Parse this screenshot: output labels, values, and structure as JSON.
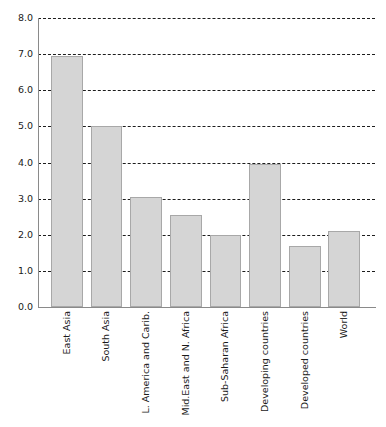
{
  "chart_data": {
    "type": "bar",
    "title": "",
    "subtitle": "",
    "xlabel": "",
    "ylabel": "",
    "categories": [
      "East Asia",
      "South Asia",
      "L. America and Carib.",
      "Mid.East and N. Africa",
      "Sub-Saharan Africa",
      "Developing countries",
      "Developed countries",
      "World"
    ],
    "values": [
      6.95,
      5.0,
      3.05,
      2.55,
      2.0,
      3.97,
      1.7,
      2.1
    ],
    "ylim": [
      0.0,
      8.0
    ],
    "ytick_step": 1.0,
    "ytick_labels": [
      "0.0",
      "1.0",
      "2.0",
      "3.0",
      "4.0",
      "5.0",
      "6.0",
      "7.0",
      "8.0"
    ],
    "ytick_values": [
      0.0,
      1.0,
      2.0,
      3.0,
      4.0,
      5.0,
      6.0,
      7.0,
      8.0
    ],
    "grid": true,
    "grid_axis": "y",
    "grid_style": "dashed",
    "legend": false,
    "legend_position": "none",
    "annotations": [],
    "colors": {
      "bar_fill": "#d5d5d5",
      "bar_border": "#a8a8a8",
      "gridline": "#1d1d1d",
      "axis": "#8a8a8a",
      "text": "#1a1a1a",
      "background": "#ffffff"
    }
  }
}
